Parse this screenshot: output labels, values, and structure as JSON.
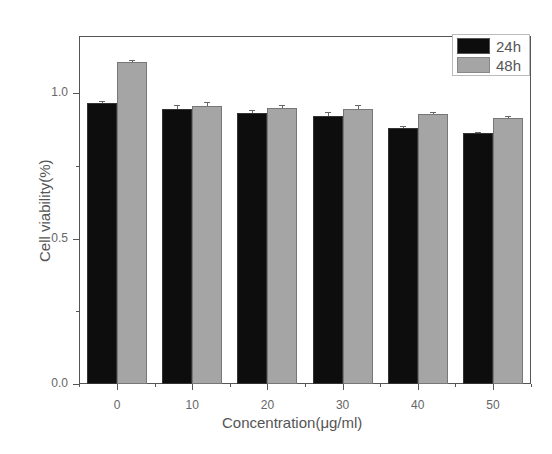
{
  "chart_data": {
    "type": "bar",
    "title": "",
    "xlabel": "Concentration(μg/ml)",
    "ylabel": "Cell viability(%)",
    "categories": [
      "0",
      "10",
      "20",
      "30",
      "40",
      "50"
    ],
    "series": [
      {
        "name": "24h",
        "color": "#0d0d0d",
        "values": [
          0.966,
          0.945,
          0.93,
          0.92,
          0.88,
          0.862
        ],
        "errors": [
          0.005,
          0.015,
          0.012,
          0.013,
          0.006,
          0.005
        ]
      },
      {
        "name": "48h",
        "color": "#a5a5a5",
        "values": [
          1.107,
          0.955,
          0.948,
          0.945,
          0.928,
          0.914
        ],
        "errors": [
          0.006,
          0.015,
          0.012,
          0.013,
          0.008,
          0.006
        ]
      }
    ],
    "ylim": [
      0.0,
      1.2
    ],
    "yticks": [
      "0.0",
      "0.5",
      "1.0"
    ],
    "grid": false,
    "legend_position": "top-right"
  },
  "axes": {
    "x_title": "Concentration(μg/ml)",
    "y_title": "Cell viability(%)",
    "y_tick_labels": [
      "0.0",
      "0.5",
      "1.0"
    ],
    "x_tick_labels": [
      "0",
      "10",
      "20",
      "30",
      "40",
      "50"
    ]
  },
  "legend": {
    "items": [
      {
        "label": "24h",
        "color": "#0d0d0d"
      },
      {
        "label": "48h",
        "color": "#a5a5a5"
      }
    ]
  }
}
